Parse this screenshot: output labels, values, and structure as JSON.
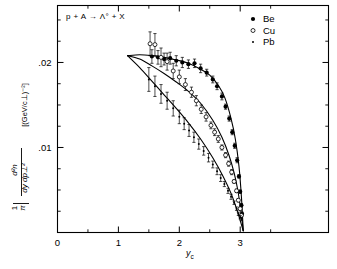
{
  "figure": {
    "reaction_label": "p + A → Λ° + X",
    "xaxis_label": "y",
    "xaxis_label_sub": "c",
    "yaxis_units": "[(GeV/c⊥)⁻²]",
    "yaxis_numerator": "d²n",
    "yaxis_denominator": "dy dp⊥²",
    "yaxis_prefactor_num": "1",
    "yaxis_prefactor_den": "π",
    "ink_color": "#000000",
    "background_color": "#ffffff"
  },
  "legend": {
    "position": "top-right",
    "entries": [
      {
        "label": "Be",
        "marker": "filled-circle"
      },
      {
        "label": "Cu",
        "marker": "open-circle"
      },
      {
        "label": "Pb",
        "marker": "small-dot"
      }
    ]
  },
  "chart_data": {
    "type": "scatter",
    "title": "p + A → Λ° + X",
    "xlabel": "y_c",
    "ylabel": "(1/π) d²n / (dy dp⊥²)  [(GeV/c)⁻²]",
    "xlim": [
      0,
      4.45
    ],
    "ylim": [
      0,
      0.0267
    ],
    "xticks": [
      0,
      1,
      2,
      3
    ],
    "xtick_labels": [
      "0",
      "1",
      "2",
      "3"
    ],
    "xminor_step": 0.5,
    "yticks": [
      0.01,
      0.02
    ],
    "ytick_labels": [
      ".01",
      ".02"
    ],
    "yminor_step": 0.0025,
    "grid": false,
    "legend_position": "top-right",
    "series": [
      {
        "name": "Be",
        "marker": "filled-circle",
        "x": [
          1.55,
          1.65,
          1.75,
          1.85,
          1.95,
          2.05,
          2.15,
          2.25,
          2.35,
          2.45,
          2.55,
          2.62,
          2.7,
          2.76,
          2.82,
          2.87,
          2.91,
          2.95,
          2.98,
          3.0,
          3.02,
          3.03
        ],
        "y": [
          0.0207,
          0.0206,
          0.0204,
          0.0205,
          0.0202,
          0.02,
          0.0198,
          0.0199,
          0.0193,
          0.0188,
          0.018,
          0.0172,
          0.016,
          0.0148,
          0.0134,
          0.0118,
          0.0102,
          0.0085,
          0.0066,
          0.0048,
          0.0032,
          0.0022
        ],
        "yerr": [
          0.0008,
          0.0008,
          0.0007,
          0.0007,
          0.0006,
          0.0006,
          0.0005,
          0.0005,
          0.0005,
          0.0004,
          0.0004,
          0.0004,
          0.0004,
          0.0003,
          0.0003,
          0.0003,
          0.0003,
          0.0003,
          0.0002,
          0.0002,
          0.0002,
          0.0002
        ]
      },
      {
        "name": "Cu",
        "marker": "open-circle",
        "x": [
          1.52,
          1.6,
          1.7,
          1.8,
          1.9,
          2.0,
          2.1,
          2.2,
          2.28,
          2.36,
          2.44,
          2.52,
          2.58,
          2.64,
          2.7,
          2.76,
          2.81,
          2.86,
          2.9,
          2.94,
          2.97,
          3.0,
          3.02
        ],
        "y": [
          0.0222,
          0.0221,
          0.0206,
          0.0201,
          0.019,
          0.0183,
          0.0174,
          0.0165,
          0.0155,
          0.0145,
          0.0136,
          0.0126,
          0.0118,
          0.011,
          0.01,
          0.0091,
          0.0081,
          0.0071,
          0.006,
          0.0049,
          0.0038,
          0.0028,
          0.002
        ],
        "yerr": [
          0.0014,
          0.0013,
          0.0011,
          0.001,
          0.0009,
          0.0008,
          0.0007,
          0.0006,
          0.0006,
          0.0005,
          0.0005,
          0.0004,
          0.0004,
          0.0004,
          0.0003,
          0.0003,
          0.0003,
          0.0003,
          0.0002,
          0.0002,
          0.0002,
          0.0002,
          0.0002
        ]
      },
      {
        "name": "Pb",
        "marker": "small-dot",
        "x": [
          1.5,
          1.6,
          1.7,
          1.8,
          1.9,
          2.0,
          2.08,
          2.16,
          2.24,
          2.32,
          2.4,
          2.48,
          2.55,
          2.62,
          2.68,
          2.74,
          2.8,
          2.85,
          2.9,
          2.94,
          2.97,
          3.0,
          3.02
        ],
        "y": [
          0.018,
          0.0172,
          0.0163,
          0.0155,
          0.0146,
          0.0136,
          0.0128,
          0.012,
          0.0112,
          0.0104,
          0.0096,
          0.0088,
          0.008,
          0.0072,
          0.0064,
          0.0057,
          0.0049,
          0.0042,
          0.0035,
          0.0028,
          0.0022,
          0.0018,
          0.0016
        ],
        "yerr": [
          0.0014,
          0.0012,
          0.0011,
          0.001,
          0.0009,
          0.0008,
          0.0007,
          0.0007,
          0.0006,
          0.0006,
          0.0005,
          0.0005,
          0.0004,
          0.0004,
          0.0004,
          0.0003,
          0.0003,
          0.0003,
          0.0002,
          0.0002,
          0.0002,
          0.0002,
          0.0002
        ]
      }
    ],
    "fit_curves": [
      {
        "name": "Be-fit",
        "x": [
          1.15,
          1.35,
          1.55,
          1.75,
          1.95,
          2.15,
          2.35,
          2.5,
          2.65,
          2.75,
          2.85,
          2.92,
          2.98,
          3.02,
          3.05
        ],
        "y": [
          0.0208,
          0.0209,
          0.0208,
          0.0206,
          0.0203,
          0.0199,
          0.0192,
          0.0185,
          0.0172,
          0.0158,
          0.0134,
          0.011,
          0.0078,
          0.0042,
          0.0002
        ]
      },
      {
        "name": "Cu-fit",
        "x": [
          1.15,
          1.35,
          1.55,
          1.75,
          1.95,
          2.15,
          2.35,
          2.55,
          2.7,
          2.82,
          2.9,
          2.96,
          3.01,
          3.05
        ],
        "y": [
          0.0208,
          0.0204,
          0.0196,
          0.0187,
          0.0177,
          0.0166,
          0.0152,
          0.0132,
          0.0112,
          0.009,
          0.007,
          0.005,
          0.0026,
          0.0002
        ]
      },
      {
        "name": "Pb-fit",
        "x": [
          1.15,
          1.35,
          1.55,
          1.75,
          1.95,
          2.15,
          2.35,
          2.55,
          2.72,
          2.85,
          2.94,
          3.0,
          3.05
        ],
        "y": [
          0.0208,
          0.0194,
          0.0178,
          0.0162,
          0.0146,
          0.0129,
          0.011,
          0.0088,
          0.0066,
          0.0046,
          0.0028,
          0.0014,
          0.0002
        ]
      }
    ]
  }
}
